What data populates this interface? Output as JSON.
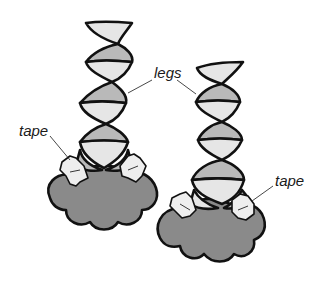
{
  "figure": {
    "labels": {
      "legs": "legs",
      "tape_left": "tape",
      "tape_right": "tape"
    },
    "colors": {
      "background": "#ffffff",
      "light_strip": "#e6e6e6",
      "dark_strip": "#b9b9b9",
      "base": "#8a8a8a",
      "tape": "#eeeeee",
      "outline": "#111111"
    }
  }
}
